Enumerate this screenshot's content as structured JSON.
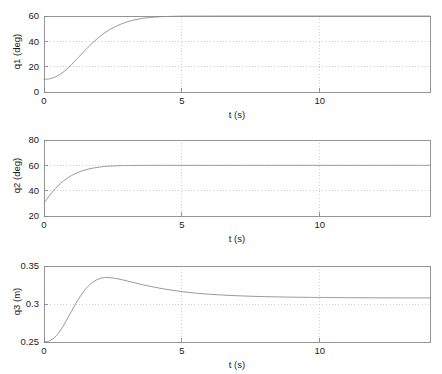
{
  "figure": {
    "background": "#ffffff",
    "curve_color": "#9a9a9a",
    "axis_color": "#8a8a8a",
    "grid_color": "#b9b9b9",
    "text_color": "#1a1a1a"
  },
  "chart_data": [
    {
      "type": "line",
      "id": "q1",
      "title": "",
      "xlabel": "t (s)",
      "ylabel": "q1 (deg)",
      "xlim": [
        0,
        14
      ],
      "ylim": [
        0,
        60
      ],
      "xticks": [
        0,
        5,
        10
      ],
      "xticklabels": [
        "0",
        "5",
        "10"
      ],
      "yticks": [
        0,
        20,
        40,
        60
      ],
      "yticklabels": [
        "0",
        "20",
        "40",
        "60"
      ],
      "grid": true,
      "grid_style": "dotted",
      "legend": null,
      "series": [
        {
          "name": "q1",
          "x": [
            0.0,
            0.2,
            0.4,
            0.6,
            0.8,
            1.0,
            1.2,
            1.4,
            1.6,
            1.8,
            2.0,
            2.2,
            2.4,
            2.6,
            2.8,
            3.0,
            3.2,
            3.4,
            3.6,
            3.8,
            4.0,
            4.3,
            4.6,
            5.0,
            5.5,
            6.0,
            7.0,
            8.0,
            9.0,
            10.0,
            11.0,
            12.0,
            13.0,
            14.0
          ],
          "values": [
            10.0,
            10.4,
            11.8,
            14.2,
            17.6,
            21.7,
            26.2,
            30.9,
            35.4,
            39.6,
            43.4,
            46.7,
            49.5,
            51.8,
            53.7,
            55.3,
            56.5,
            57.4,
            58.2,
            58.7,
            59.1,
            59.5,
            59.7,
            59.9,
            59.95,
            59.98,
            60.0,
            60.0,
            60.0,
            60.0,
            60.0,
            60.0,
            60.0,
            60.0
          ]
        }
      ],
      "start_value": 10,
      "final_value": 60
    },
    {
      "type": "line",
      "id": "q2",
      "title": "",
      "xlabel": "t (s)",
      "ylabel": "q2 (deg)",
      "xlim": [
        0,
        14
      ],
      "ylim": [
        20,
        80
      ],
      "xticks": [
        0,
        5,
        10
      ],
      "xticklabels": [
        "0",
        "5",
        "10"
      ],
      "yticks": [
        20,
        40,
        60,
        80
      ],
      "yticklabels": [
        "20",
        "40",
        "60",
        "80"
      ],
      "grid": true,
      "grid_style": "dotted",
      "legend": null,
      "series": [
        {
          "name": "q2",
          "x": [
            0.0,
            0.1,
            0.2,
            0.3,
            0.4,
            0.5,
            0.6,
            0.8,
            1.0,
            1.2,
            1.4,
            1.6,
            1.8,
            2.0,
            2.2,
            2.5,
            2.8,
            3.0,
            3.5,
            4.0,
            5.0,
            6.0,
            7.0,
            8.0,
            10.0,
            12.0,
            14.0
          ],
          "values": [
            30.0,
            33.2,
            36.2,
            38.9,
            41.4,
            43.7,
            45.8,
            49.2,
            52.0,
            54.1,
            55.8,
            57.0,
            57.9,
            58.6,
            59.1,
            59.5,
            59.8,
            59.85,
            59.95,
            60.0,
            60.0,
            60.0,
            60.0,
            60.0,
            60.0,
            60.0,
            60.0
          ]
        }
      ],
      "start_value": 30,
      "final_value": 60
    },
    {
      "type": "line",
      "id": "q3",
      "title": "",
      "xlabel": "t (s)",
      "ylabel": "q3 (m)",
      "xlim": [
        0,
        14
      ],
      "ylim": [
        0.25,
        0.35
      ],
      "xticks": [
        0,
        5,
        10
      ],
      "xticklabels": [
        "0",
        "5",
        "10"
      ],
      "yticks": [
        0.25,
        0.3,
        0.35
      ],
      "yticklabels": [
        "0.25",
        "0.3",
        "0.35"
      ],
      "grid": true,
      "grid_style": "dotted",
      "legend": null,
      "series": [
        {
          "name": "q3",
          "x": [
            0.0,
            0.2,
            0.4,
            0.6,
            0.8,
            1.0,
            1.2,
            1.4,
            1.6,
            1.8,
            2.0,
            2.2,
            2.4,
            2.6,
            2.8,
            3.0,
            3.3,
            3.6,
            4.0,
            4.5,
            5.0,
            5.5,
            6.0,
            6.5,
            7.0,
            7.5,
            8.0,
            8.5,
            9.0,
            9.5,
            10.0,
            11.0,
            12.0,
            13.0,
            14.0
          ],
          "values": [
            0.25,
            0.2515,
            0.2565,
            0.2655,
            0.2775,
            0.2905,
            0.3035,
            0.3145,
            0.3235,
            0.3295,
            0.3332,
            0.3348,
            0.3347,
            0.3337,
            0.3322,
            0.3305,
            0.3278,
            0.3252,
            0.3222,
            0.3189,
            0.3163,
            0.3143,
            0.3128,
            0.3117,
            0.3109,
            0.3102,
            0.3097,
            0.3093,
            0.309,
            0.3088,
            0.3086,
            0.3083,
            0.3081,
            0.308,
            0.308
          ]
        }
      ],
      "start_value": 0.25,
      "peak_value": 0.335,
      "peak_time": 2.2,
      "final_value": 0.308
    }
  ]
}
